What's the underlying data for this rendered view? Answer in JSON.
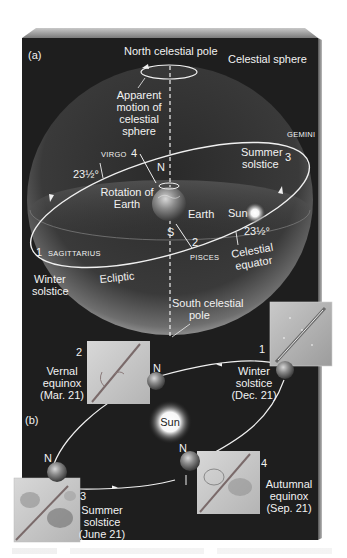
{
  "figure": {
    "panel_a": {
      "tag": "(a)",
      "north_pole_label": "North celestial pole",
      "sphere_label": "Celestial sphere",
      "apparent_motion_label": [
        "Apparent",
        "motion of",
        "celestial",
        "sphere"
      ],
      "rotation_label": [
        "Rotation of",
        "Earth"
      ],
      "earth_label": "Earth",
      "sun_label": "Sun",
      "north_marker": "N",
      "south_marker": "S",
      "tilt_left": "23½°",
      "tilt_right": "23½°",
      "ecliptic_label": "Ecliptic",
      "celestial_equator_label": [
        "Celestial",
        "equator"
      ],
      "south_pole_label": [
        "South celestial",
        "pole"
      ],
      "winter_solstice_label": [
        "Winter",
        "solstice"
      ],
      "summer_solstice_label": [
        "Summer",
        "solstice"
      ],
      "constellations": {
        "virgo": "VIRGO",
        "gemini": "GEMINI",
        "sagittarius": "SAGITTARIUS",
        "pisces": "PISCES"
      },
      "position_numbers": {
        "p1": "1",
        "p2": "2",
        "p3": "3",
        "p4": "4"
      }
    },
    "panel_b": {
      "tag": "(b)",
      "sun_label": "Sun",
      "north_marker": "N",
      "seasons": [
        {
          "number": "1",
          "name": [
            "Winter",
            "solstice"
          ],
          "date": "(Dec. 21)"
        },
        {
          "number": "2",
          "name": [
            "Vernal",
            "equinox"
          ],
          "date": "(Mar. 21)"
        },
        {
          "number": "3",
          "name": [
            "Summer",
            "solstice"
          ],
          "date": "(June 21)"
        },
        {
          "number": "4",
          "name": [
            "Autumnal",
            "equinox"
          ],
          "date": "(Sep. 21)"
        }
      ]
    },
    "colors": {
      "background_panel": "#1e1e1e",
      "panel_top_face": "#9a9a9a",
      "sphere_edge": "#8a8a8a",
      "orbit_line": "#f0f0f0",
      "text": "#f2f2f2"
    }
  }
}
